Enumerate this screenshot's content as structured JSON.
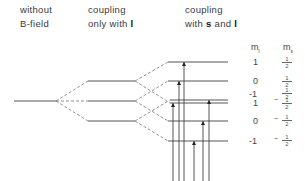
{
  "headers": {
    "col1": {
      "line1": "without",
      "line2": "B-field"
    },
    "col2": {
      "line1": "coupling",
      "line2_prefix": "only with ",
      "line2_bold": "l"
    },
    "col3": {
      "line1": "coupling",
      "line2_prefix": "with ",
      "line2_bold1": "s",
      "line2_mid": " and ",
      "line2_bold2": "l"
    }
  },
  "quantum_number_headers": {
    "ml": "m",
    "ml_sub": "l",
    "ms": "m",
    "ms_sub": "s"
  },
  "levels": [
    {
      "ml": "1",
      "ms_sign": "",
      "ms": "1/2"
    },
    {
      "ml": "0",
      "ms_sign": "",
      "ms": "1/2"
    },
    {
      "ml": "-1",
      "ms_sign": "",
      "ms": "1/2"
    },
    {
      "ml": "1",
      "ms_sign": "−",
      "ms": "1/2"
    },
    {
      "ml": "0",
      "ms_sign": "−",
      "ms": "1/2"
    },
    {
      "ml": "-1",
      "ms_sign": "−",
      "ms": "1/2"
    }
  ],
  "fraction": {
    "num": "1",
    "den": "2"
  }
}
